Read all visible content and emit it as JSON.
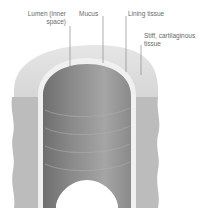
{
  "diagram": {
    "labels": {
      "lumen_line1": "Lumen (inner",
      "lumen_line2": "space)",
      "mucus": "Mucus",
      "lining": "Lining tissue",
      "cartilage_line1": "Stiff, cartilaginous",
      "cartilage_line2": "tissue"
    },
    "colors": {
      "outer_top": "#dcdcdc",
      "outer_side": "#bdbdbd",
      "lining_band": "#f2f2f2",
      "lumen_dark": "#7a7a7a",
      "lumen_mid": "#9a9a9a",
      "leader_line": "#8a8a8a",
      "label_text": "#6a6a6a"
    }
  }
}
